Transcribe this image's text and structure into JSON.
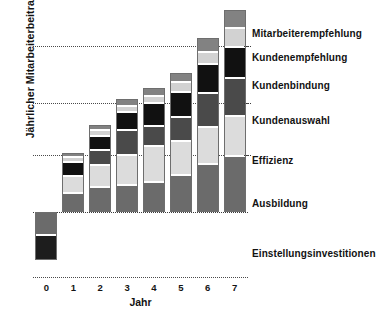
{
  "chart_data": {
    "type": "bar",
    "subtype": "stacked-bar-with-negative-baseline",
    "title": "",
    "xlabel": "Jahr",
    "ylabel": "Jährlicher Mitarbeiterbeitrag",
    "categories": [
      "0",
      "1",
      "2",
      "3",
      "4",
      "5",
      "6",
      "7"
    ],
    "grid": true,
    "grid_orientation": "horizontal",
    "grid_lines_count": 3,
    "legend_position": "right-inline",
    "axis_values_shown": false,
    "series": [
      {
        "name": "Einstellungsinvestitionen",
        "color": "#555555",
        "note": "negative, year 0 only, two-tone block below baseline",
        "values": [
          -43,
          0,
          0,
          0,
          0,
          0,
          0,
          0
        ]
      },
      {
        "name": "Ausbildung",
        "color": "#6b6b6b",
        "values": [
          0,
          17,
          22,
          24,
          27,
          33,
          43,
          50
        ]
      },
      {
        "name": "Effizienz",
        "color": "#dcdcdc",
        "values": [
          0,
          15,
          20,
          27,
          32,
          30,
          33,
          36
        ]
      },
      {
        "name": "Kundenauswahl",
        "color": "#4a4a4a",
        "values": [
          0,
          0,
          13,
          22,
          18,
          22,
          30,
          34
        ]
      },
      {
        "name": "Kundenbindung",
        "color": "#111111",
        "values": [
          0,
          13,
          13,
          16,
          20,
          22,
          26,
          27
        ]
      },
      {
        "name": "Kundenempfehlung",
        "color": "#d2d2d2",
        "values": [
          0,
          4,
          5,
          6,
          7,
          9,
          11,
          17
        ]
      },
      {
        "name": "Mitarbeiterempfehlung",
        "color": "#828282",
        "values": [
          0,
          4,
          5,
          6,
          7,
          8,
          12,
          16
        ]
      }
    ],
    "annotations": [
      "Year 0 bar lies below the zero baseline and represents hiring investment.",
      "Bars 1-7 stack six contribution categories and grow monotonically."
    ]
  },
  "legend": {
    "items": [
      {
        "label": "Mitarbeiterempfehlung"
      },
      {
        "label": "Kundenempfehlung"
      },
      {
        "label": "Kundenbindung"
      },
      {
        "label": "Kundenauswahl"
      },
      {
        "label": "Effizienz"
      },
      {
        "label": "Ausbildung"
      },
      {
        "label": "Einstellungsinvestitionen"
      }
    ]
  },
  "axes": {
    "x": {
      "label": "Jahr",
      "ticks": [
        "0",
        "1",
        "2",
        "3",
        "4",
        "5",
        "6",
        "7"
      ]
    },
    "y": {
      "label": "Jährlicher Mitarbeiterbeitrag"
    }
  }
}
